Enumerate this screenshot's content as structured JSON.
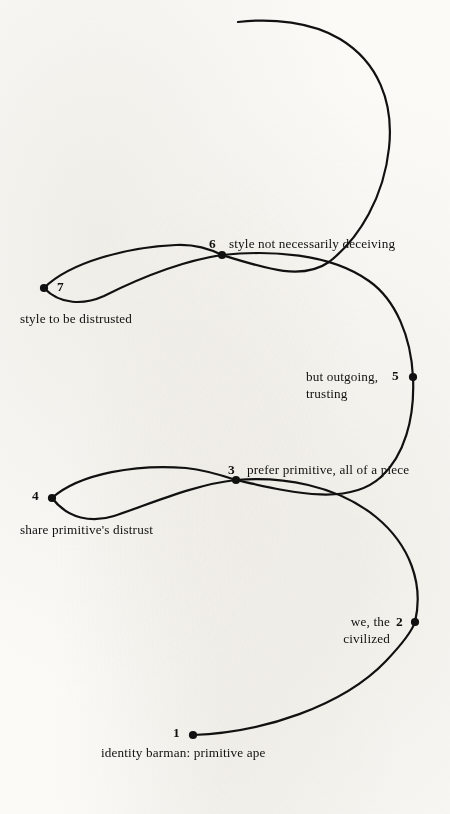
{
  "page": {
    "background_color": "#fbfaf7",
    "ink_color": "#111111",
    "width": 450,
    "height": 814
  },
  "diagram": {
    "type": "hand-drawn serpentine spiral with numbered nodes",
    "node_count": 7,
    "stroke_color": "#111111",
    "stroke_width": 2.2,
    "nodes": [
      {
        "number": "1",
        "label": "identity barman: primitive ape",
        "x": 193,
        "y": 735,
        "label_position": "below-center",
        "num_position": "left"
      },
      {
        "number": "2",
        "label": "we, the\ncivilized",
        "label_line1": "we, the",
        "label_line2": "civilized",
        "x": 415,
        "y": 622,
        "label_position": "left",
        "num_position": "left"
      },
      {
        "number": "3",
        "label": "prefer primitive, all of a piece",
        "x": 236,
        "y": 480,
        "label_position": "right",
        "num_position": "left"
      },
      {
        "number": "4",
        "label": "share primitive's distrust",
        "x": 52,
        "y": 498,
        "label_position": "below-right",
        "num_position": "left"
      },
      {
        "number": "5",
        "label": "but outgoing,\ntrusting",
        "label_line1": "but outgoing,",
        "label_line2": "trusting",
        "x": 413,
        "y": 377,
        "label_position": "left",
        "num_position": "left"
      },
      {
        "number": "6",
        "label": "style not necessarily deceiving",
        "x": 222,
        "y": 255,
        "label_position": "right",
        "num_position": "left"
      },
      {
        "number": "7",
        "label": "style to be distrusted",
        "x": 44,
        "y": 288,
        "label_position": "below-right",
        "num_position": "right"
      }
    ]
  }
}
